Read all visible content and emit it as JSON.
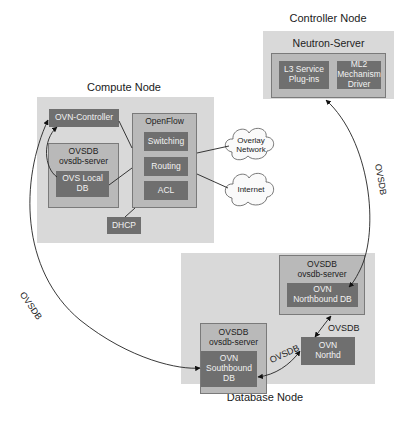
{
  "diagram": {
    "controller_node": {
      "label": "Controller Node",
      "server": "Neutron-Server",
      "components": [
        {
          "line1": "L3 Service",
          "line2": "Plug-ins"
        },
        {
          "line1": "ML2",
          "line2": "Mechanism",
          "line3": "Driver"
        }
      ]
    },
    "compute_node": {
      "label": "Compute Node",
      "ovn_controller": "OVN-Controller",
      "ovsdb": {
        "title": "OVSDB",
        "subtitle": "ovsdb-server",
        "db_line1": "OVS Local",
        "db_line2": "DB"
      },
      "openflow": {
        "title": "OpenFlow",
        "items": [
          "Switching",
          "Routing",
          "ACL"
        ]
      },
      "dhcp": "DHCP"
    },
    "clouds": [
      {
        "line1": "Overlay",
        "line2": "Network"
      },
      {
        "line1": "Internet"
      }
    ],
    "database_node": {
      "label": "Database Node",
      "northbound": {
        "title": "OVSDB",
        "subtitle": "ovsdb-server",
        "db_line1": "OVN",
        "db_line2": "Northbound DB"
      },
      "southbound": {
        "title": "OVSDB",
        "subtitle": "ovsdb-server",
        "db_line1": "OVN",
        "db_line2": "Southbound",
        "db_line3": "DB"
      },
      "northd": {
        "line1": "OVN",
        "line2": "Northd"
      }
    },
    "edges": {
      "controller_to_northbound": "OVSDB",
      "compute_to_southbound": "OVSDB",
      "northd_to_northbound": "OVSDB",
      "northd_to_southbound": "OVSDB"
    },
    "colors": {
      "outer_box": "#d9d9d9",
      "frame": "#b9b9b9",
      "component": "#6f6f6f",
      "component_text": "#f2f2f2"
    }
  }
}
